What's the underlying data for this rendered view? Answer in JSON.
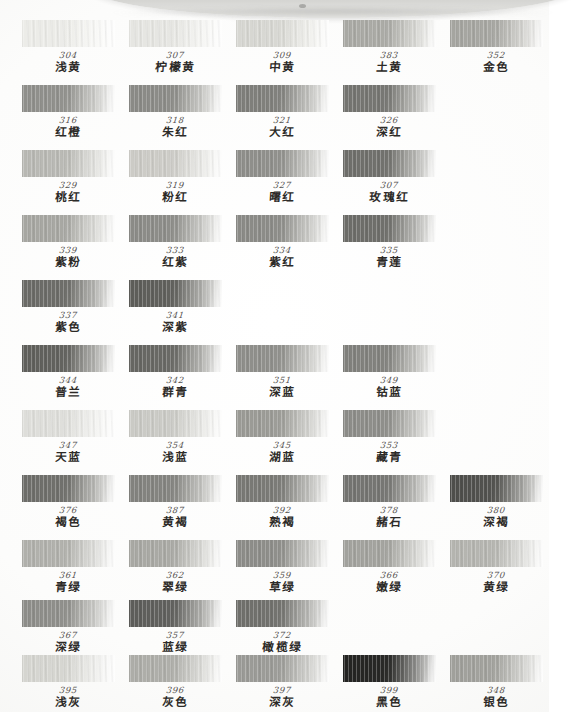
{
  "document": {
    "kind": "handwritten-color-pencil-swatch-chart",
    "object_label": "tin-lid",
    "columns": 5,
    "rows": 11,
    "column_x": [
      22,
      129,
      236,
      343,
      450
    ],
    "row_y": [
      22,
      87,
      152,
      217,
      282,
      347,
      412,
      477,
      542,
      602,
      657
    ]
  },
  "rows": [
    {
      "group": "yellow",
      "cells": [
        {
          "code": "304",
          "name": "浅黄",
          "hex": "#ecece8",
          "hex2": "#f7f7f4"
        },
        {
          "code": "307",
          "name": "柠檬黄",
          "hex": "#e6e6e2",
          "hex2": "#f4f4f1"
        },
        {
          "code": "309",
          "name": "中黄",
          "hex": "#d7d7d2",
          "hex2": "#eeeee9"
        },
        {
          "code": "383",
          "name": "土黄",
          "hex": "#a9a9a4",
          "hex2": "#cfcfc9"
        },
        {
          "code": "352",
          "name": "金色",
          "hex": "#a5a5a0",
          "hex2": "#cccbc6"
        }
      ]
    },
    {
      "group": "red-orange",
      "cells": [
        {
          "code": "316",
          "name": "红橙",
          "hex": "#8f8f8b",
          "hex2": "#c2c2bd"
        },
        {
          "code": "318",
          "name": "朱红",
          "hex": "#8a8a86",
          "hex2": "#bdbdb8"
        },
        {
          "code": "321",
          "name": "大红",
          "hex": "#7e7e7a",
          "hex2": "#b5b5b0"
        },
        {
          "code": "326",
          "name": "深红",
          "hex": "#747470",
          "hex2": "#aeaea9"
        },
        {
          "code": "",
          "name": "",
          "hex": "",
          "hex2": ""
        }
      ]
    },
    {
      "group": "pink-rose",
      "cells": [
        {
          "code": "329",
          "name": "桃红",
          "hex": "#b8b8b3",
          "hex2": "#dedeD9"
        },
        {
          "code": "319",
          "name": "粉红",
          "hex": "#cccbc6",
          "hex2": "#e8e8e4"
        },
        {
          "code": "327",
          "name": "曙红",
          "hex": "#8e8e8a",
          "hex2": "#c0c0bb"
        },
        {
          "code": "307",
          "name": "玫瑰红",
          "hex": "#6e6e6a",
          "hex2": "#a6a6a1"
        },
        {
          "code": "",
          "name": "",
          "hex": "",
          "hex2": ""
        }
      ]
    },
    {
      "group": "violet-magenta",
      "cells": [
        {
          "code": "339",
          "name": "紫粉",
          "hex": "#a6a6a1",
          "hex2": "#d6d6d1"
        },
        {
          "code": "333",
          "name": "红紫",
          "hex": "#8b8b87",
          "hex2": "#c1c1bc"
        },
        {
          "code": "334",
          "name": "紫红",
          "hex": "#8a8a86",
          "hex2": "#bfbfba"
        },
        {
          "code": "335",
          "name": "青莲",
          "hex": "#6c6c68",
          "hex2": "#a5a5a0"
        },
        {
          "code": "",
          "name": "",
          "hex": "",
          "hex2": ""
        }
      ]
    },
    {
      "group": "purple",
      "cells": [
        {
          "code": "337",
          "name": "紫色",
          "hex": "#6a6a66",
          "hex2": "#a3a39e"
        },
        {
          "code": "341",
          "name": "深紫",
          "hex": "#5d5d59",
          "hex2": "#9b9b96"
        },
        {
          "code": "",
          "name": "",
          "hex": "",
          "hex2": ""
        },
        {
          "code": "",
          "name": "",
          "hex": "",
          "hex2": ""
        },
        {
          "code": "",
          "name": "",
          "hex": "",
          "hex2": ""
        }
      ]
    },
    {
      "group": "blue-deep",
      "cells": [
        {
          "code": "344",
          "name": "普兰",
          "hex": "#5f5f5b",
          "hex2": "#9d9d98"
        },
        {
          "code": "342",
          "name": "群青",
          "hex": "#666662",
          "hex2": "#a2a29d"
        },
        {
          "code": "351",
          "name": "深蓝",
          "hex": "#8e8e8a",
          "hex2": "#c2c2bd"
        },
        {
          "code": "349",
          "name": "钴蓝",
          "hex": "#80807c",
          "hex2": "#b6b6b1"
        },
        {
          "code": "",
          "name": "",
          "hex": "",
          "hex2": ""
        }
      ]
    },
    {
      "group": "blue-light",
      "cells": [
        {
          "code": "347",
          "name": "天蓝",
          "hex": "#dededa",
          "hex2": "#f2f2ef"
        },
        {
          "code": "354",
          "name": "浅蓝",
          "hex": "#cacac5",
          "hex2": "#e7e7e3"
        },
        {
          "code": "345",
          "name": "湖蓝",
          "hex": "#9a9a95",
          "hex2": "#c9c9c4"
        },
        {
          "code": "353",
          "name": "藏青",
          "hex": "#8c8c88",
          "hex2": "#c0c0bb"
        },
        {
          "code": "",
          "name": "",
          "hex": "",
          "hex2": ""
        }
      ]
    },
    {
      "group": "brown",
      "cells": [
        {
          "code": "376",
          "name": "褐色",
          "hex": "#6d6d69",
          "hex2": "#a8a8a3"
        },
        {
          "code": "387",
          "name": "黄褐",
          "hex": "#82827e",
          "hex2": "#b7b7b2"
        },
        {
          "code": "392",
          "name": "熟褐",
          "hex": "#787874",
          "hex2": "#b0b0ab"
        },
        {
          "code": "378",
          "name": "赭石",
          "hex": "#737370",
          "hex2": "#ababa6"
        },
        {
          "code": "380",
          "name": "深褐",
          "hex": "#4e4e4b",
          "hex2": "#8d8d88"
        }
      ]
    },
    {
      "group": "green",
      "cells": [
        {
          "code": "361",
          "name": "青绿",
          "hex": "#b0b0ab",
          "hex2": "#dadad6"
        },
        {
          "code": "362",
          "name": "翠绿",
          "hex": "#a8a8a3",
          "hex2": "#d6d6d1"
        },
        {
          "code": "359",
          "name": "草绿",
          "hex": "#8c8c88",
          "hex2": "#c0c0bb"
        },
        {
          "code": "366",
          "name": "嫩绿",
          "hex": "#a2a29d",
          "hex2": "#d1d1cc"
        },
        {
          "code": "370",
          "name": "黄绿",
          "hex": "#b4b4af",
          "hex2": "#dcdcd8"
        }
      ]
    },
    {
      "group": "green-deep",
      "cells": [
        {
          "code": "367",
          "name": "深绿",
          "hex": "#8d8d89",
          "hex2": "#c0c0bb"
        },
        {
          "code": "357",
          "name": "蓝绿",
          "hex": "#5d5d5a",
          "hex2": "#9a9a95"
        },
        {
          "code": "372",
          "name": "橄榄绿",
          "hex": "#6f6f6b",
          "hex2": "#a8a8a3"
        },
        {
          "code": "",
          "name": "",
          "hex": "",
          "hex2": ""
        },
        {
          "code": "",
          "name": "",
          "hex": "",
          "hex2": ""
        }
      ]
    },
    {
      "group": "neutral",
      "cells": [
        {
          "code": "395",
          "name": "浅灰",
          "hex": "#d5d5d0",
          "hex2": "#ededea"
        },
        {
          "code": "396",
          "name": "灰色",
          "hex": "#adada8",
          "hex2": "#d7d7d2"
        },
        {
          "code": "397",
          "name": "深灰",
          "hex": "#9a9a96",
          "hex2": "#c8c8c3"
        },
        {
          "code": "399",
          "name": "黑色",
          "hex": "#232321",
          "hex2": "#6e6e6a"
        },
        {
          "code": "348",
          "name": "银色",
          "hex": "#a0a09b",
          "hex2": "#cacac5"
        }
      ]
    }
  ]
}
